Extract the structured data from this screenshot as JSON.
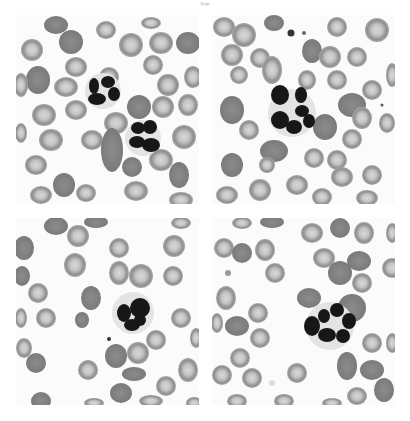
{
  "figure": {
    "header_fragment": "ly/pi",
    "panels": [
      {
        "position": "top-left",
        "content": "two neutrophils with segmented nuclei surrounded by red blood cells"
      },
      {
        "position": "top-right",
        "content": "single hypersegmented neutrophil surrounded by red blood cells, small platelets near top"
      },
      {
        "position": "bottom-left",
        "content": "single neutrophil with lobed nucleus surrounded by red blood cells"
      },
      {
        "position": "bottom-right",
        "content": "single hypersegmented neutrophil surrounded by red blood cells"
      }
    ]
  },
  "colors": {
    "background": "#ffffff",
    "rbc_rim": "#9a9a9a",
    "rbc_center": "#cfcfcf",
    "rbc_dense": "#8a8a8a",
    "nucleus": "#1a1a1a",
    "cytoplasm": "#e6e6e6"
  }
}
